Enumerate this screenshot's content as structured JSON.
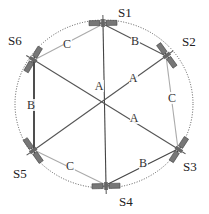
{
  "diagram": {
    "center": {
      "x": 104,
      "y": 101
    },
    "orbit": {
      "rx": 89,
      "ry": 84,
      "style": "dotted",
      "color": "#555555"
    },
    "satellites": [
      {
        "id": "S1",
        "x": 103,
        "y": 24,
        "label": "S1",
        "lx": 118,
        "ly": 17
      },
      {
        "id": "S2",
        "x": 166,
        "y": 56,
        "label": "S2",
        "lx": 182,
        "ly": 46
      },
      {
        "id": "S3",
        "x": 178,
        "y": 149,
        "label": "S3",
        "lx": 183,
        "ly": 171
      },
      {
        "id": "S4",
        "x": 106,
        "y": 185,
        "label": "S4",
        "lx": 119,
        "ly": 206
      },
      {
        "id": "S5",
        "x": 34,
        "y": 150,
        "label": "S5",
        "lx": 13,
        "ly": 178
      },
      {
        "id": "S6",
        "x": 34,
        "y": 60,
        "label": "S6",
        "lx": 8,
        "ly": 45
      }
    ],
    "links": [
      {
        "from": "S1",
        "to": "S4",
        "label": "A",
        "lx": 99,
        "ly": 90,
        "color": "#444444"
      },
      {
        "from": "S2",
        "to": "S5",
        "label": "A",
        "lx": 133,
        "ly": 82,
        "color": "#555555"
      },
      {
        "from": "S6",
        "to": "S3",
        "label": "A",
        "lx": 134,
        "ly": 122,
        "color": "#555555"
      },
      {
        "from": "S1",
        "to": "S2",
        "label": "B",
        "lx": 135,
        "ly": 45,
        "color": "#555555"
      },
      {
        "from": "S6",
        "to": "S5",
        "label": "B",
        "lx": 31,
        "ly": 109,
        "color": "#222222"
      },
      {
        "from": "S3",
        "to": "S4",
        "label": "B",
        "lx": 143,
        "ly": 167,
        "color": "#444444"
      },
      {
        "from": "S6",
        "to": "S1",
        "label": "C",
        "lx": 67,
        "ly": 48,
        "color": "#aaaaaa"
      },
      {
        "from": "S2",
        "to": "S3",
        "label": "C",
        "lx": 172,
        "ly": 102,
        "color": "#aaaaaa"
      },
      {
        "from": "S5",
        "to": "S4",
        "label": "C",
        "lx": 70,
        "ly": 170,
        "color": "#aaaaaa"
      }
    ]
  }
}
